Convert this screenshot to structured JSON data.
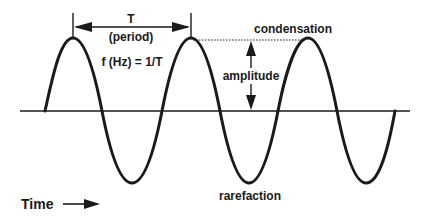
{
  "diagram": {
    "labels": {
      "period_symbol": "T",
      "period_text": "(period)",
      "frequency": "f (Hz) = 1/T",
      "amplitude": "amplitude",
      "condensation": "condensation",
      "rarefaction": "rarefaction",
      "time": "Time"
    },
    "icons": {
      "time_arrow": "right-arrow-icon"
    },
    "colors": {
      "ink": "#1a1a1a",
      "background": "#ffffff"
    },
    "geometry": {
      "baseline_y": 111,
      "peak_y": 38,
      "trough_y": 183,
      "peaks_x": [
        73,
        191,
        308
      ],
      "troughs_x": [
        132,
        249,
        366
      ],
      "wave_start_x": 45,
      "wave_end_x": 395
    }
  }
}
